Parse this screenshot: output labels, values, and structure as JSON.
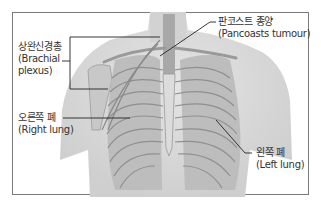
{
  "diagram": {
    "labels": {
      "brachial_plexus": {
        "ko": "상완신경총",
        "en": "(Brachial",
        "en2": "plexus)"
      },
      "pancoast_tumour": {
        "ko": "판코스트 종양",
        "en": "(Pancoasts tumour)"
      },
      "right_lung": {
        "ko": "오른쪽 폐",
        "en": "(Right lung)"
      },
      "left_lung": {
        "ko": "왼쪽 폐",
        "en": "(Left lung)"
      }
    },
    "colors": {
      "frame": "#7a7a7a",
      "skin": "#d9d9d9",
      "rib": "#9a9a9a",
      "lung": "#b8b8b8",
      "leader": "#222222"
    }
  }
}
